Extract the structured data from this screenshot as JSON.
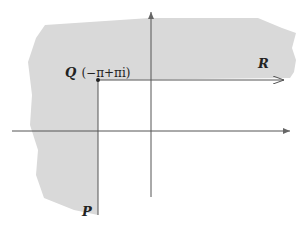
{
  "diagram": {
    "type": "complex-plane-contour",
    "colors": {
      "region_fill": "#d9d9d9",
      "axis": "#555555",
      "path": "#555555",
      "text": "#222222"
    },
    "points": {
      "Q": {
        "name": "Q",
        "value": "(−π+πi)"
      },
      "R": {
        "name": "R"
      },
      "P": {
        "name": "P"
      }
    }
  }
}
